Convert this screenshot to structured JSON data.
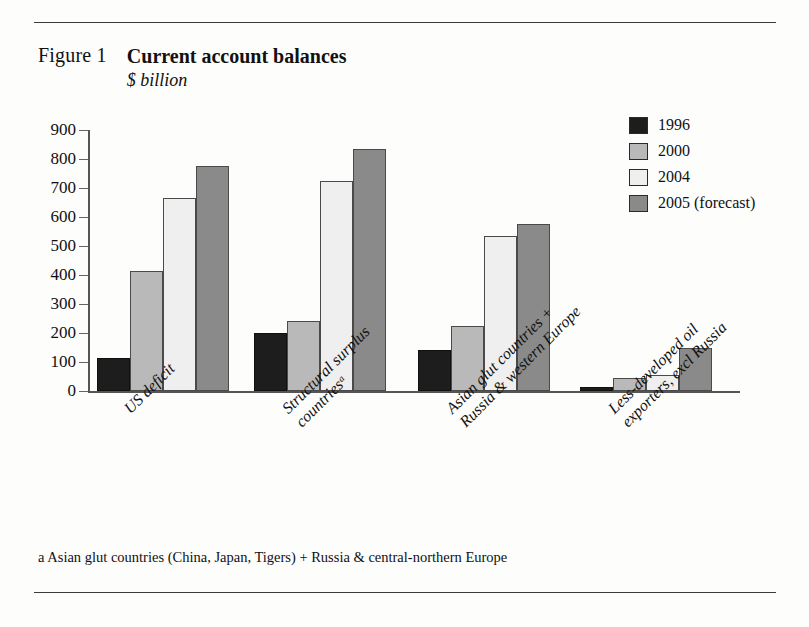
{
  "figure": {
    "label": "Figure 1",
    "title": "Current account balances",
    "subtitle": "$ billion",
    "footnote": "a Asian glut countries (China, Japan, Tigers) + Russia & central-northern Europe"
  },
  "legend": {
    "position": "top-right",
    "entries": [
      {
        "label": "1996",
        "color": "#1d1d1d"
      },
      {
        "label": "2000",
        "color": "#b9b9b9"
      },
      {
        "label": "2004",
        "color": "#efefef"
      },
      {
        "label": "2005 (forecast)",
        "color": "#8a8a8a"
      }
    ]
  },
  "axis": {
    "y_ticks": [
      "900",
      "800",
      "700",
      "600",
      "500",
      "400",
      "300",
      "200",
      "100",
      "0"
    ]
  },
  "categories": [
    {
      "lines": [
        "US deficit"
      ]
    },
    {
      "lines": [
        "Structural surplus",
        "countriesᵃ"
      ]
    },
    {
      "lines": [
        "Asian glut countries +",
        "Russia & western Europe"
      ]
    },
    {
      "lines": [
        "Less-developed oil",
        "exporters, excl Russia"
      ]
    }
  ],
  "chart_data": {
    "type": "bar",
    "title": "Current account balances",
    "subtitle": "$ billion",
    "xlabel": "",
    "ylabel": "$ billion",
    "ylim": [
      0,
      900
    ],
    "ytick_step": 100,
    "grid": false,
    "legend_position": "top-right",
    "categories": [
      "US deficit",
      "Structural surplus countriesᵃ",
      "Asian glut countries + Russia & western Europe",
      "Less-developed oil exporters, excl Russia"
    ],
    "series": [
      {
        "name": "1996",
        "color": "#1d1d1d",
        "values": [
          115,
          200,
          140,
          15
        ]
      },
      {
        "name": "2000",
        "color": "#b9b9b9",
        "values": [
          415,
          240,
          225,
          45
        ]
      },
      {
        "name": "2004",
        "color": "#efefef",
        "values": [
          665,
          725,
          535,
          55
        ]
      },
      {
        "name": "2005 (forecast)",
        "color": "#8a8a8a",
        "values": [
          775,
          835,
          575,
          150
        ]
      }
    ],
    "annotations": [
      "a Asian glut countries (China, Japan, Tigers) + Russia & central-northern Europe"
    ]
  }
}
